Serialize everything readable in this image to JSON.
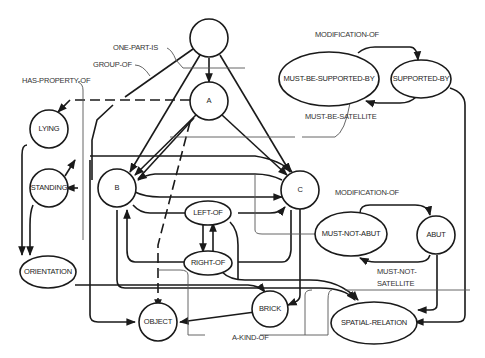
{
  "diagram": {
    "nodes": {
      "top": "",
      "a": "A",
      "b": "B",
      "c": "C",
      "lying": "LYING",
      "standing": "STANDING",
      "orientation": "ORIENTATION",
      "left_of": "LEFT-OF",
      "right_of": "RIGHT-OF",
      "object": "OBJECT",
      "brick": "BRICK",
      "must_be_supported_by": "MUST-BE-SUPPORTED-BY",
      "supported_by": "SUPPORTED-BY",
      "must_not_abut": "MUST-NOT-ABUT",
      "abut": "ABUT",
      "spatial_relation": "SPATIAL-RELATION"
    },
    "relations": {
      "one_part_is": "ONE-PART-IS",
      "group_of": "GROUP-OF",
      "has_property_of": "HAS-PROPERTY-OF",
      "modification_of_1": "MODIFICATION-OF",
      "must_be_satellite": "MUST-BE-SATELLITE",
      "modification_of_2": "MODIFICATION-OF",
      "must_not_satellite_1": "MUST-NOT-",
      "must_not_satellite_2": "SATELLITE",
      "a_kind_of": "A-KIND-OF"
    }
  }
}
